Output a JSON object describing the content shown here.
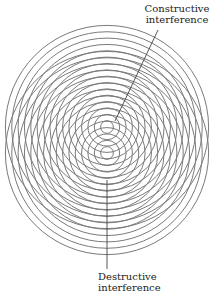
{
  "diagram": {
    "type": "two-source wave interference",
    "sources": [
      {
        "name": "upper-source",
        "cx": 107,
        "cy": 127
      },
      {
        "name": "lower-source",
        "cx": 107,
        "cy": 153
      }
    ],
    "ring_count": 16,
    "ring_spacing": 6.35,
    "ring_color": "#7a7a7a",
    "pointer_color": "#444444"
  },
  "labels": {
    "constructive": {
      "line1": "Constructive",
      "line2": "interference"
    },
    "destructive": {
      "line1": "Destructive",
      "line2": "interference"
    }
  },
  "pointers": {
    "constructive": {
      "x1": 158,
      "y1": 30,
      "x2": 115,
      "y2": 121
    },
    "destructive": {
      "x1": 107,
      "y1": 180,
      "x2": 107,
      "y2": 269
    }
  }
}
